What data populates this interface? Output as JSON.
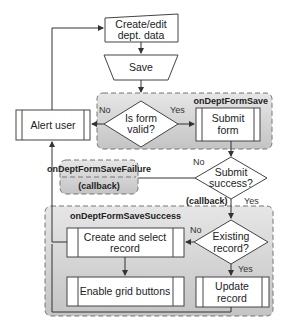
{
  "nodes": {
    "create_edit": {
      "line1": "Create/edit",
      "line2": "dept. data"
    },
    "save": {
      "label": "Save"
    },
    "is_form_valid": {
      "line1": "Is form",
      "line2": "valid?"
    },
    "submit_form": {
      "line1": "Submit",
      "line2": "form"
    },
    "alert_user": {
      "label": "Alert user"
    },
    "submit_success": {
      "line1": "Submit",
      "line2": "success?"
    },
    "existing_record": {
      "line1": "Existing",
      "line2": "record?"
    },
    "create_select": {
      "line1": "Create and select",
      "line2": "record"
    },
    "enable_grid": {
      "label": "Enable grid buttons"
    },
    "update_record": {
      "line1": "Update",
      "line2": "record"
    }
  },
  "groups": {
    "on_save": {
      "title": "onDeptFormSave"
    },
    "on_failure": {
      "title": "onDeptFormSaveFailure",
      "subtitle": "(callback)"
    },
    "on_success": {
      "title": "onDeptFormSaveSuccess"
    }
  },
  "edges": {
    "form_valid_no": "No",
    "form_valid_yes": "Yes",
    "submit_no": "No",
    "submit_callback": "(callback)",
    "submit_yes": "Yes",
    "existing_no": "No",
    "existing_yes": "Yes"
  },
  "colors": {
    "group_fill": "#cfcfcf",
    "box_fill": "#ffffff",
    "stroke": "#444444"
  }
}
